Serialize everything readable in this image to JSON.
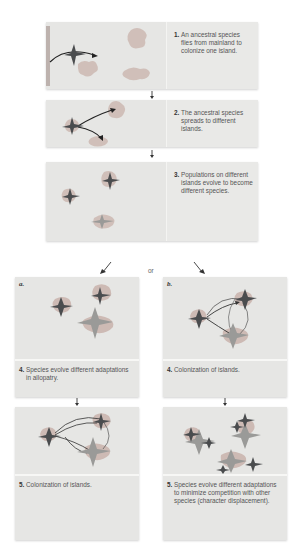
{
  "figure": {
    "colors": {
      "panel_bg": "#e6e6e4",
      "bird_dark": "#4a4c4e",
      "bird_light": "#9a9a98",
      "island": "#c8b4ae",
      "arrow": "#333333"
    },
    "steps": [
      {
        "number": "1.",
        "text": "An ancestral species flies from mainland to colonize one island."
      },
      {
        "number": "2.",
        "text": "The ancestral species spreads to different islands."
      },
      {
        "number": "3.",
        "text": "Populations on different islands evolve to become different species."
      }
    ],
    "branch_connector": "or",
    "branches": [
      {
        "label": "a.",
        "steps": [
          {
            "number": "4.",
            "text": "Species evolve different adaptations in allopatry."
          },
          {
            "number": "5.",
            "text": "Colonization of islands."
          }
        ]
      },
      {
        "label": "b.",
        "steps": [
          {
            "number": "4.",
            "text": "Colonization of islands."
          },
          {
            "number": "5.",
            "text": "Species evolve different adaptations to minimize competition with other species (character displacement)."
          }
        ]
      }
    ]
  }
}
